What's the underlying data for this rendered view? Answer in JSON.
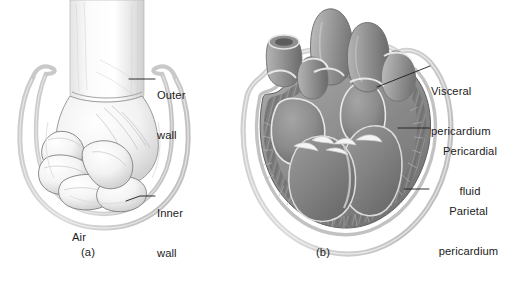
{
  "figure": {
    "background_color": "#ffffff",
    "text_color": "#1b1b1b",
    "line_color": "#1b1b1b",
    "membrane_color": "#c9c9c9",
    "heart_muscle_color": "#8a8a8a",
    "heart_shadow_color": "#6e6e6e"
  },
  "panel_a": {
    "caption": "(a)",
    "subject": "fist pushed into a balloon",
    "labels": [
      {
        "id": "outer-wall",
        "line1": "Outer",
        "line2": "wall"
      },
      {
        "id": "inner-wall",
        "line1": "Inner",
        "line2": "wall"
      },
      {
        "id": "air",
        "line1": "Air",
        "line2": ""
      }
    ]
  },
  "panel_b": {
    "caption": "(b)",
    "subject": "coronal section of heart within pericardial sac",
    "labels": [
      {
        "id": "visceral-pericardium",
        "line1": "Visceral",
        "line2": "pericardium"
      },
      {
        "id": "pericardial-fluid",
        "line1": "Pericardial",
        "line2": "fluid"
      },
      {
        "id": "parietal-pericardium",
        "line1": "Parietal",
        "line2": "pericardium"
      }
    ]
  }
}
